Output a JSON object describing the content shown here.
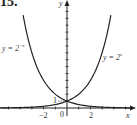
{
  "figure": {
    "number_label": "15."
  },
  "chart_data": {
    "type": "line",
    "title": "",
    "xlabel": "x",
    "ylabel": "y",
    "xlim": [
      -5.7,
      5.8
    ],
    "ylim": [
      -0.5,
      15.5
    ],
    "x_ticks": [
      -2,
      0,
      2
    ],
    "x_tick_labels": [
      "−2",
      "0",
      "2"
    ],
    "y_tick_labels": [
      "1"
    ],
    "grid": false,
    "legend": "none (inline curve labels)",
    "series": [
      {
        "name": "y = 2^-x",
        "label": "y = 2⁻ˣ",
        "function": "2^(-x)",
        "x": [
          -3.75,
          -3,
          -2,
          -1,
          0,
          1,
          2,
          3,
          4,
          5,
          5.5
        ],
        "values": [
          13.45,
          8,
          4,
          2,
          1,
          0.5,
          0.25,
          0.125,
          0.0625,
          0.031,
          0.022
        ]
      },
      {
        "name": "y = 2^x",
        "label": "y = 2ˣ",
        "function": "2^x",
        "x": [
          -5.5,
          -5,
          -4,
          -3,
          -2,
          -1,
          0,
          1,
          2,
          3,
          3.75
        ],
        "values": [
          0.022,
          0.031,
          0.0625,
          0.125,
          0.25,
          0.5,
          1,
          2,
          4,
          8,
          13.45
        ]
      }
    ],
    "annotations": [
      {
        "text": "1",
        "at": [
          0,
          1
        ],
        "note": "dashed leader to y-axis at intersection point (0,1)"
      }
    ]
  },
  "labels": {
    "fig": "15.",
    "y_axis": "y",
    "x_axis": "x",
    "tick_neg2": "−2",
    "tick_0": "0",
    "tick_2": "2",
    "tick_y1": "1",
    "curve_left": "y = 2",
    "curve_left_exp": "−x",
    "curve_right": "y = 2",
    "curve_right_exp": "x"
  }
}
